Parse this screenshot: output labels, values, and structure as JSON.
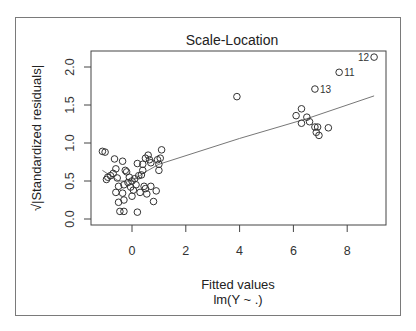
{
  "chart_data": {
    "type": "scatter",
    "title": "Scale-Location",
    "xlabel": "Fitted values",
    "xsublabel": "lm(Y ~ .)",
    "ylabel": "√|Standardized residuals|",
    "xlim": [
      -1.5,
      9.4
    ],
    "ylim": [
      -0.08,
      2.2
    ],
    "xticks": [
      0,
      2,
      4,
      6,
      8
    ],
    "yticks": [
      0.0,
      0.5,
      1.0,
      1.5,
      2.0
    ],
    "ytick_labels": [
      "0.0",
      "0.5",
      "1.0",
      "1.5",
      "2.0"
    ],
    "grid": false,
    "colors": {
      "points": "#333333",
      "smooth_line": "#777777",
      "axes": "#444444"
    },
    "labeled_points": [
      {
        "label": "12",
        "x": 9.0,
        "y": 2.13
      },
      {
        "label": "11",
        "x": 7.7,
        "y": 1.93
      },
      {
        "label": "13",
        "x": 6.8,
        "y": 1.71
      }
    ],
    "points": [
      [
        9.0,
        2.13
      ],
      [
        7.7,
        1.93
      ],
      [
        6.8,
        1.71
      ],
      [
        3.9,
        1.61
      ],
      [
        6.1,
        1.36
      ],
      [
        6.3,
        1.45
      ],
      [
        6.3,
        1.26
      ],
      [
        6.5,
        1.34
      ],
      [
        6.6,
        1.28
      ],
      [
        6.8,
        1.21
      ],
      [
        6.9,
        1.21
      ],
      [
        6.85,
        1.14
      ],
      [
        6.95,
        1.1
      ],
      [
        7.3,
        1.2
      ],
      [
        -1.1,
        0.89
      ],
      [
        -1.0,
        0.88
      ],
      [
        -0.95,
        0.52
      ],
      [
        -0.9,
        0.55
      ],
      [
        -0.8,
        0.57
      ],
      [
        -0.7,
        0.6
      ],
      [
        -0.65,
        0.79
      ],
      [
        -0.6,
        0.66
      ],
      [
        -0.55,
        0.54
      ],
      [
        -0.6,
        0.35
      ],
      [
        -0.5,
        0.43
      ],
      [
        -0.5,
        0.22
      ],
      [
        -0.45,
        0.1
      ],
      [
        -0.3,
        0.1
      ],
      [
        -0.35,
        0.76
      ],
      [
        -0.35,
        0.34
      ],
      [
        -0.3,
        0.25
      ],
      [
        -0.3,
        0.45
      ],
      [
        -0.25,
        0.64
      ],
      [
        -0.2,
        0.62
      ],
      [
        -0.15,
        0.48
      ],
      [
        -0.1,
        0.55
      ],
      [
        -0.05,
        0.42
      ],
      [
        0.0,
        0.3
      ],
      [
        0.0,
        0.5
      ],
      [
        0.05,
        0.38
      ],
      [
        0.1,
        0.53
      ],
      [
        0.15,
        0.45
      ],
      [
        0.2,
        0.09
      ],
      [
        0.2,
        0.73
      ],
      [
        0.25,
        0.57
      ],
      [
        0.3,
        0.35
      ],
      [
        0.35,
        0.58
      ],
      [
        0.4,
        0.72
      ],
      [
        0.4,
        0.64
      ],
      [
        0.45,
        0.43
      ],
      [
        0.5,
        0.8
      ],
      [
        0.5,
        0.4
      ],
      [
        0.55,
        0.33
      ],
      [
        0.6,
        0.84
      ],
      [
        0.65,
        0.78
      ],
      [
        0.7,
        0.74
      ],
      [
        0.7,
        0.43
      ],
      [
        0.8,
        0.23
      ],
      [
        0.9,
        0.37
      ],
      [
        0.95,
        0.78
      ],
      [
        1.0,
        0.64
      ],
      [
        1.0,
        0.72
      ],
      [
        1.05,
        0.8
      ],
      [
        1.1,
        0.91
      ]
    ],
    "smooth_line": [
      [
        -1.1,
        0.64
      ],
      [
        -0.5,
        0.5
      ],
      [
        0.0,
        0.5
      ],
      [
        0.5,
        0.62
      ],
      [
        1.0,
        0.72
      ],
      [
        4.0,
        1.06
      ],
      [
        6.5,
        1.32
      ],
      [
        9.0,
        1.62
      ]
    ]
  }
}
